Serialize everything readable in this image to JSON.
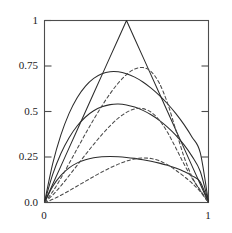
{
  "chart_data": {
    "type": "line",
    "title": "",
    "xlabel": "",
    "ylabel": "",
    "xlim": [
      0,
      1
    ],
    "ylim": [
      0,
      1
    ],
    "grid": false,
    "legend": null,
    "x_ticks": [
      0,
      1
    ],
    "x_tick_labels": [
      "0",
      "1"
    ],
    "y_ticks": [
      0.0,
      0.25,
      0.5,
      0.75,
      1
    ],
    "y_tick_labels": [
      "0.0",
      "0.25",
      "0.5",
      "0.75",
      "1"
    ],
    "x": [
      0,
      0.05,
      0.1,
      0.15,
      0.2,
      0.25,
      0.3,
      0.35,
      0.4,
      0.45,
      0.5,
      0.55,
      0.6,
      0.65,
      0.7,
      0.75,
      0.8,
      0.85,
      0.9,
      0.95,
      1
    ],
    "series": [
      {
        "name": "solid-peak-1.00",
        "style": "solid",
        "peak": 1.0,
        "peak_x": 0.5,
        "color": "#2b2b2b",
        "values": [
          0,
          0.1,
          0.2,
          0.3,
          0.4,
          0.5,
          0.6,
          0.7,
          0.8,
          0.9,
          1.0,
          0.9,
          0.8,
          0.7,
          0.6,
          0.5,
          0.4,
          0.3,
          0.2,
          0.1,
          0
        ]
      },
      {
        "name": "solid-peak-0.75",
        "style": "solid",
        "peak": 0.75,
        "peak_x": 0.5,
        "color": "#2b2b2b",
        "values": [
          0,
          0.2133,
          0.3713,
          0.4898,
          0.5773,
          0.6399,
          0.6822,
          0.7076,
          0.7189,
          0.7184,
          0.7079,
          0.6888,
          0.6622,
          0.6288,
          0.5889,
          0.5427,
          0.4898,
          0.4293,
          0.3589,
          0.2728,
          0
        ]
      },
      {
        "name": "solid-peak-0.50",
        "style": "solid",
        "peak": 0.5,
        "peak_x": 0.5,
        "color": "#2b2b2b",
        "values": [
          0,
          0.1543,
          0.2691,
          0.356,
          0.4215,
          0.4698,
          0.5039,
          0.5259,
          0.5377,
          0.5407,
          0.5359,
          0.5243,
          0.5062,
          0.4819,
          0.4515,
          0.4146,
          0.3706,
          0.3179,
          0.2535,
          0.1705,
          0
        ]
      },
      {
        "name": "solid-peak-0.25",
        "style": "solid",
        "peak": 0.25,
        "peak_x": 0.5,
        "color": "#2b2b2b",
        "values": [
          0,
          0.0882,
          0.149,
          0.1903,
          0.2178,
          0.2355,
          0.246,
          0.2513,
          0.2528,
          0.2514,
          0.2478,
          0.2424,
          0.2354,
          0.2268,
          0.2164,
          0.204,
          0.189,
          0.1705,
          0.1466,
          0.1119,
          0
        ]
      },
      {
        "name": "dashed-inner-0.75",
        "style": "dashed",
        "peak": 0.7225,
        "peak_x": 0.575,
        "color": "#4a4a4a",
        "values": [
          0,
          0.0598,
          0.1338,
          0.2142,
          0.2965,
          0.378,
          0.4567,
          0.5307,
          0.5981,
          0.6565,
          0.703,
          0.7334,
          0.7416,
          0.7191,
          0.656,
          0.5463,
          0.4005,
          0.2527,
          0.1413,
          0.0635,
          0
        ]
      },
      {
        "name": "dashed-inner-0.50",
        "style": "dashed",
        "peak": 0.4875,
        "peak_x": 0.6,
        "color": "#4a4a4a",
        "values": [
          0,
          0.0407,
          0.0916,
          0.1475,
          0.2054,
          0.2633,
          0.3196,
          0.373,
          0.4216,
          0.4633,
          0.4952,
          0.5141,
          0.5158,
          0.4962,
          0.4527,
          0.3857,
          0.3013,
          0.2127,
          0.1332,
          0.0674,
          0
        ]
      },
      {
        "name": "dashed-inner-0.25",
        "style": "dashed",
        "peak": 0.2125,
        "peak_x": 0.625,
        "color": "#4a4a4a",
        "values": [
          0,
          0.0176,
          0.0399,
          0.0647,
          0.0907,
          0.1169,
          0.1427,
          0.1675,
          0.1905,
          0.2109,
          0.2276,
          0.2393,
          0.2445,
          0.2416,
          0.2293,
          0.2075,
          0.1779,
          0.1437,
          0.1058,
          0.06,
          0
        ]
      }
    ]
  },
  "axes": {
    "frame_color": "#4d4d4d",
    "tick_color": "#4d4d4d"
  }
}
